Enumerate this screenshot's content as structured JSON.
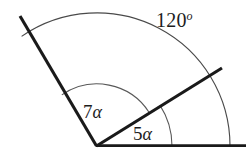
{
  "figure": {
    "kind": "geometry-angle-diagram",
    "background_color": "#ffffff",
    "line_color": "#1a1a1a",
    "arc_color": "#585858",
    "text_color": "#1d1d1d",
    "vertex": {
      "x": 97,
      "y": 146
    },
    "rays": [
      {
        "name": "baseline-ray",
        "angle_deg": 0,
        "from": {
          "x": 97,
          "y": 146
        },
        "to": {
          "x": 246,
          "y": 146
        }
      },
      {
        "name": "middle-ray",
        "angle_deg": 33,
        "from": {
          "x": 97,
          "y": 146
        },
        "to": {
          "x": 222,
          "y": 68
        }
      },
      {
        "name": "upper-left-ray",
        "angle_deg": 124.5,
        "from": {
          "x": 97,
          "y": 146
        },
        "to": {
          "x": 20,
          "y": 16
        }
      }
    ],
    "arcs": [
      {
        "name": "outer-arc",
        "radius": 133,
        "start_angle_deg": 0,
        "end_angle_deg": 124.5,
        "label_ref": "outer"
      },
      {
        "name": "inner-arc",
        "radius": 62,
        "start_angle_deg": 33,
        "end_angle_deg": 124.5,
        "label_ref": "inner"
      },
      {
        "name": "small-arc",
        "radius": 75,
        "start_angle_deg": 0,
        "end_angle_deg": 33,
        "label_ref": "small"
      }
    ]
  },
  "labels": {
    "outer": {
      "value": "120",
      "degree_symbol": "o",
      "full": "120o"
    },
    "inner": {
      "coefficient": "7",
      "symbol": "α",
      "full": "7α"
    },
    "small": {
      "coefficient": "5",
      "symbol": "α",
      "full": "5α"
    }
  }
}
